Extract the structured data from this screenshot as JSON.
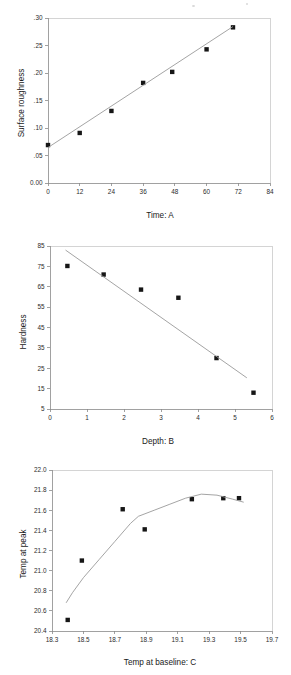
{
  "document": {
    "kind": "scanned-figure-page",
    "panel_count": 3
  },
  "chart_data": [
    {
      "id": "surface-roughness-vs-time",
      "type": "scatter",
      "title": "",
      "xlabel": "Time: A",
      "ylabel": "Surface roughness",
      "xlim": [
        0,
        84
      ],
      "ylim": [
        0.0,
        0.3
      ],
      "xticks": [
        0,
        12,
        24,
        36,
        48,
        60,
        72,
        84
      ],
      "xticklabels": [
        "0",
        "12",
        "24",
        "36",
        "48",
        "60",
        "72",
        "84"
      ],
      "yticks": [
        0.0,
        0.05,
        0.1,
        0.15,
        0.2,
        0.25,
        0.3
      ],
      "yticklabels": [
        "0.00",
        ".05",
        ".10",
        ".15",
        ".20",
        ".25",
        ".30"
      ],
      "grid": false,
      "legend": "none",
      "series": [
        {
          "name": "observed",
          "kind": "points",
          "x": [
            0,
            12,
            24,
            36,
            47,
            60,
            70
          ],
          "y": [
            0.069,
            0.091,
            0.131,
            0.182,
            0.202,
            0.243,
            0.283
          ]
        },
        {
          "name": "fitted line",
          "kind": "line",
          "x": [
            0,
            70
          ],
          "y": [
            0.0645,
            0.2845
          ]
        }
      ]
    },
    {
      "id": "hardness-vs-depth",
      "type": "scatter",
      "title": "",
      "xlabel": "Depth: B",
      "ylabel": "Hardness",
      "xlim": [
        0,
        6
      ],
      "ylim": [
        5,
        85
      ],
      "xticks": [
        0,
        1,
        2,
        3,
        4,
        5,
        6
      ],
      "xticklabels": [
        "0",
        "1",
        "2",
        "3",
        "4",
        "5",
        "6"
      ],
      "yticks": [
        5,
        15,
        25,
        35,
        45,
        55,
        65,
        75,
        85
      ],
      "yticklabels": [
        "5",
        "15",
        "25",
        "35",
        "45",
        "55",
        "65",
        "75",
        "85"
      ],
      "grid": false,
      "legend": "none",
      "series": [
        {
          "name": "observed",
          "kind": "points",
          "x": [
            0.47,
            1.45,
            2.46,
            3.47,
            4.5,
            5.5
          ],
          "y": [
            75.2,
            71.0,
            63.6,
            59.6,
            30.0,
            13.0
          ]
        },
        {
          "name": "fitted line",
          "kind": "line",
          "x": [
            0.42,
            5.32
          ],
          "y": [
            83.0,
            20.3
          ]
        }
      ]
    },
    {
      "id": "temp-at-peak-vs-temp-at-baseline",
      "type": "scatter",
      "title": "",
      "xlabel": "Temp at baseline: C",
      "ylabel": "Temp at peak",
      "xlim": [
        18.3,
        19.7
      ],
      "ylim": [
        20.4,
        22.0
      ],
      "xticks": [
        18.3,
        18.5,
        18.7,
        18.9,
        19.1,
        19.3,
        19.5,
        19.7
      ],
      "xticklabels": [
        "18.3",
        "18.5",
        "18.7",
        "18.9",
        "19.1",
        "19.3",
        "19.5",
        "19.7"
      ],
      "yticks": [
        20.4,
        20.6,
        20.8,
        21.0,
        21.2,
        21.4,
        21.6,
        21.8,
        22.0
      ],
      "yticklabels": [
        "20.4",
        "20.6",
        "20.8",
        "21.0",
        "21.2",
        "21.4",
        "21.6",
        "21.8",
        "22.0"
      ],
      "grid": false,
      "legend": "none",
      "series": [
        {
          "name": "observed",
          "kind": "points",
          "x": [
            18.4,
            18.49,
            18.75,
            18.89,
            19.19,
            19.39,
            19.49
          ],
          "y": [
            20.51,
            21.1,
            21.61,
            21.41,
            21.71,
            21.72,
            21.72
          ]
        },
        {
          "name": "fitted curve",
          "kind": "line",
          "x": [
            18.39,
            18.43,
            18.5,
            18.6,
            18.7,
            18.8,
            18.85,
            18.95,
            19.05,
            19.15,
            19.25,
            19.35,
            19.45,
            19.52
          ],
          "y": [
            20.68,
            20.78,
            20.93,
            21.11,
            21.29,
            21.47,
            21.54,
            21.6,
            21.66,
            21.72,
            21.76,
            21.75,
            21.71,
            21.68
          ]
        }
      ]
    }
  ]
}
